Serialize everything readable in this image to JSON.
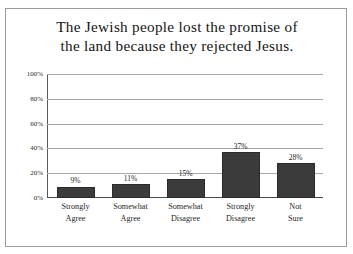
{
  "figure": {
    "title_line1": "The Jewish people lost the promise of",
    "title_line2": "the land because they rejected Jesus.",
    "frame_color": "#9a9a9a",
    "bar_color": "#3b3b3b",
    "gridline_color": "#a8a8a8",
    "background_color": "#ffffff"
  },
  "chart_data": {
    "type": "bar",
    "title": "The Jewish people lost the promise of the land because they rejected Jesus.",
    "xlabel": "",
    "ylabel": "",
    "ylim": [
      0,
      100
    ],
    "yticks": [
      0,
      20,
      40,
      60,
      80,
      100
    ],
    "ytick_labels": [
      "0%",
      "20%",
      "40%",
      "60%",
      "80%",
      "100%"
    ],
    "grid": true,
    "legend": false,
    "categories": [
      "Strongly Agree",
      "Somewhat Agree",
      "Somewhat Disagree",
      "Strongly Disagree",
      "Not Sure"
    ],
    "category_lines": [
      [
        "Strongly",
        "Agree"
      ],
      [
        "Somewhat",
        "Agree"
      ],
      [
        "Somewhat",
        "Disagree"
      ],
      [
        "Strongly",
        "Disagree"
      ],
      [
        "Not",
        "Sure"
      ]
    ],
    "values": [
      9,
      11,
      15,
      37,
      28
    ],
    "data_labels": [
      "9%",
      "11%",
      "15%",
      "37%",
      "28%"
    ]
  }
}
